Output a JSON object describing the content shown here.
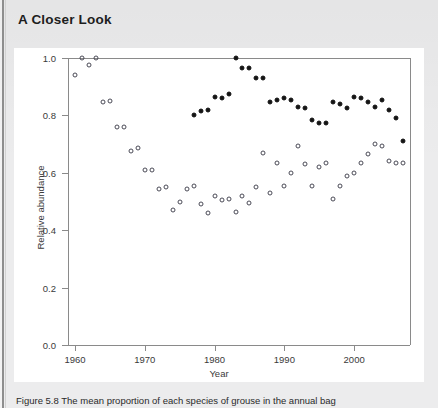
{
  "box": {
    "title": "A Closer Look"
  },
  "caption": {
    "prefix": "Figure 5.8",
    "text": "Figure 5.8  The mean proportion of each species of grouse in the annual bag"
  },
  "colors": {
    "page_background": "#ececed",
    "panel_background": "#ffffff",
    "axis": "#8a8a8a",
    "open_marker": "#4a4a56",
    "filled_marker": "#141414",
    "title_text": "#1d1d1d",
    "axis_text": "#3a3a3a"
  },
  "chart_data": {
    "type": "scatter",
    "title": "",
    "xlabel": "Year",
    "ylabel": "Relative abundance",
    "xlim": [
      1959,
      2008
    ],
    "ylim": [
      0.0,
      1.0
    ],
    "xticks": [
      1960,
      1970,
      1980,
      1990,
      2000
    ],
    "xtick_labels": [
      "1960",
      "1970",
      "1980",
      "1990",
      "2000"
    ],
    "yticks": [
      0.0,
      0.2,
      0.4,
      0.6,
      0.8,
      1.0
    ],
    "ytick_labels": [
      "0.0",
      "0.2",
      "0.4",
      "0.6",
      "0.8",
      "1.0"
    ],
    "grid": false,
    "legend": "none",
    "series": [
      {
        "name": "open-circle series",
        "marker": "open-circle",
        "x": [
          1960,
          1961,
          1962,
          1963,
          1964,
          1965,
          1966,
          1967,
          1968,
          1969,
          1970,
          1971,
          1972,
          1973,
          1974,
          1975,
          1976,
          1977,
          1978,
          1979,
          1980,
          1981,
          1982,
          1983,
          1984,
          1985,
          1986,
          1987,
          1988,
          1989,
          1990,
          1991,
          1992,
          1993,
          1994,
          1995,
          1996,
          1997,
          1998,
          1999,
          2000,
          2001,
          2002,
          2003,
          2004,
          2005,
          2006,
          2007
        ],
        "y": [
          0.94,
          1.0,
          0.975,
          1.0,
          0.845,
          0.85,
          0.76,
          0.76,
          0.675,
          0.685,
          0.61,
          0.61,
          0.545,
          0.55,
          0.47,
          0.5,
          0.545,
          0.555,
          0.49,
          0.46,
          0.52,
          0.505,
          0.51,
          0.465,
          0.52,
          0.495,
          0.55,
          0.67,
          0.53,
          0.635,
          0.555,
          0.6,
          0.695,
          0.63,
          0.555,
          0.62,
          0.635,
          0.51,
          0.555,
          0.59,
          0.6,
          0.635,
          0.665,
          0.7,
          0.695,
          0.64,
          0.635,
          0.635
        ]
      },
      {
        "name": "filled-circle series",
        "marker": "filled-circle",
        "x": [
          1977,
          1978,
          1979,
          1980,
          1981,
          1982,
          1983,
          1984,
          1985,
          1986,
          1987,
          1988,
          1989,
          1990,
          1991,
          1992,
          1993,
          1994,
          1995,
          1996,
          1997,
          1998,
          1999,
          2000,
          2001,
          2002,
          2003,
          2004,
          2005,
          2006,
          2007
        ],
        "y": [
          0.8,
          0.815,
          0.82,
          0.865,
          0.86,
          0.875,
          1.0,
          0.965,
          0.965,
          0.93,
          0.93,
          0.845,
          0.855,
          0.86,
          0.855,
          0.83,
          0.825,
          0.785,
          0.775,
          0.775,
          0.845,
          0.84,
          0.825,
          0.865,
          0.86,
          0.845,
          0.83,
          0.855,
          0.82,
          0.79,
          0.71
        ]
      }
    ]
  }
}
